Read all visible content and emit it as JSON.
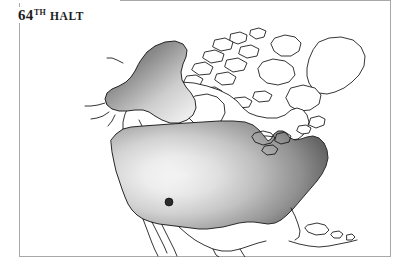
{
  "page": {
    "background_color": "#ffffff",
    "width": 408,
    "height": 270
  },
  "title": {
    "number": "64",
    "ordinal_suffix": "TH",
    "word": "HALT",
    "full_text": "64TH HALT",
    "color": "#1c1c1c"
  },
  "frame": {
    "name": "map-frame",
    "border_color": "#a8a8a8",
    "border_width_px": 1,
    "left": 19,
    "top": 0,
    "width": 372,
    "height": 257
  },
  "map": {
    "name": "north-america-map",
    "title": "North America",
    "projection_note": "North America outline map, line art",
    "outline_color": "#111111",
    "unshaded_fill": "#ffffff",
    "regions": [
      {
        "name": "alaska",
        "label": "Alaska",
        "shaded": true,
        "gradient": "linear",
        "gradient_from": "#5c5c5c",
        "gradient_to": "#e9e9e9",
        "gradient_direction": "top-left-dark to bottom-right-light"
      },
      {
        "name": "contiguous-united-states",
        "label": "Contiguous United States",
        "shaded": true,
        "gradient": "radial",
        "gradient_from": "#f2f2f2",
        "gradient_to": "#4a4a4a",
        "gradient_center": "west-central",
        "gradient_direction": "light center fading to dark toward east and edges"
      },
      {
        "name": "canada",
        "label": "Canada",
        "shaded": false,
        "gradient": "none",
        "gradient_from": "#ffffff",
        "gradient_to": "#ffffff"
      },
      {
        "name": "greenland-arctic-archipelago",
        "label": "Greenland and Arctic Archipelago",
        "shaded": false,
        "gradient": "none",
        "gradient_from": "#ffffff",
        "gradient_to": "#ffffff"
      },
      {
        "name": "mexico-central-america",
        "label": "Mexico and Central America",
        "shaded": false,
        "gradient": "none",
        "gradient_from": "#ffffff",
        "gradient_to": "#ffffff"
      },
      {
        "name": "caribbean-islands",
        "label": "Caribbean Islands",
        "shaded": false,
        "gradient": "none",
        "gradient_from": "#ffffff",
        "gradient_to": "#ffffff"
      }
    ],
    "markers": [
      {
        "name": "halt-location-marker",
        "label": "Halt location",
        "shape": "circle",
        "color": "#2b2b2b",
        "radius_px": 4,
        "x": 150,
        "y": 202,
        "region": "Great Basin / Nevada-Utah area"
      }
    ]
  }
}
